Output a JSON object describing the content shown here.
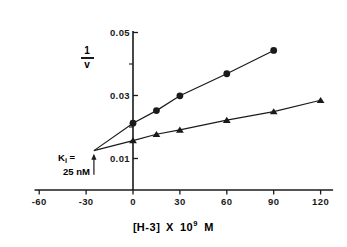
{
  "figure": {
    "kind": "dixon-plot",
    "background": "#ffffff",
    "ink_color": "#1a1a1a"
  },
  "axes": {
    "y_title_numerator": "1",
    "y_title_denominator": "v",
    "x_title_bracket_open": "[",
    "x_title_species": "H-3",
    "x_title_bracket_close": "]",
    "x_title_times": "X",
    "x_title_mantissa": "10",
    "x_title_exponent": "9",
    "x_title_unit": "M",
    "x_ticks": [
      "-60",
      "-30",
      "0",
      "30",
      "60",
      "90",
      "120"
    ],
    "y_ticks": [
      "0.01",
      "0.03",
      "0.05"
    ]
  },
  "annotation": {
    "ki_label": "K",
    "ki_subscript": "i",
    "ki_equals": "=",
    "ki_value": "25 nM"
  },
  "chart_data": {
    "type": "line",
    "title": "",
    "xlabel": "[H-3] X 10^9 M",
    "ylabel": "1/v",
    "xlim": [
      -60,
      130
    ],
    "ylim": [
      0,
      0.05
    ],
    "xticks": [
      -60,
      -30,
      0,
      30,
      60,
      90,
      120
    ],
    "yticks": [
      0.01,
      0.03,
      0.05
    ],
    "grid": false,
    "legend": "none",
    "annotations": [
      {
        "text": "Ki = 25 nM",
        "x": -25,
        "y": 0.0125,
        "marker": "arrow-up",
        "note": "lines intersect at x = -Ki"
      }
    ],
    "series": [
      {
        "name": "upper-line",
        "marker": "circle",
        "x": [
          0,
          15,
          30,
          60,
          90
        ],
        "y": [
          0.0212,
          0.0252,
          0.0299,
          0.0369,
          0.0443
        ],
        "intercept_x": -25,
        "intercept_y": 0.0125
      },
      {
        "name": "lower-line",
        "marker": "triangle",
        "x": [
          0,
          15,
          30,
          60,
          90,
          120
        ],
        "y": [
          0.0157,
          0.0177,
          0.0191,
          0.0222,
          0.0249,
          0.0285
        ],
        "intercept_x": -25,
        "intercept_y": 0.0125
      }
    ]
  }
}
